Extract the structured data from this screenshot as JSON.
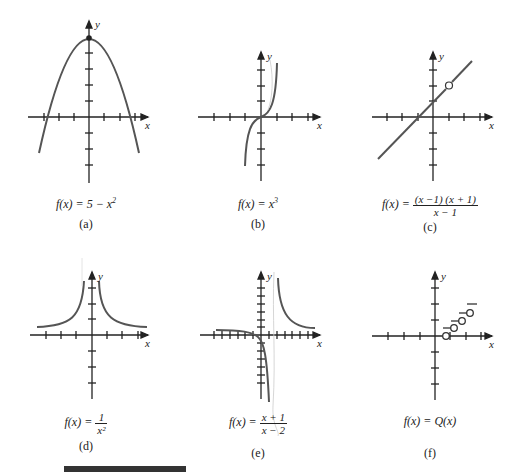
{
  "figure": {
    "panels": [
      {
        "id": "a",
        "label": "(a)",
        "formula_lhs": "f(x) = ",
        "formula_rhs": "5 − x",
        "formula_sup": "2",
        "type": "parabola"
      },
      {
        "id": "b",
        "label": "(b)",
        "formula_lhs": "f(x) = ",
        "formula_rhs": "x",
        "formula_sup": "3",
        "type": "cubic"
      },
      {
        "id": "c",
        "label": "(c)",
        "formula_lhs": "f(x) = ",
        "formula_num": "(x −1) (x + 1)",
        "formula_den": "x − 1",
        "type": "line-with-hole"
      },
      {
        "id": "d",
        "label": "(d)",
        "formula_lhs": "f(x) = ",
        "formula_num": "1",
        "formula_den": "x²",
        "type": "inverse-square"
      },
      {
        "id": "e",
        "label": "(e)",
        "formula_lhs": "f(x) = ",
        "formula_num": "x + 1",
        "formula_den": "x − 2",
        "type": "rational"
      },
      {
        "id": "f",
        "label": "(f)",
        "formula_lhs": "f(x) = ",
        "formula_rhs": "Q(x)",
        "type": "step"
      }
    ],
    "axis_labels": {
      "x": "x",
      "y": "y"
    }
  },
  "colors": {
    "curve": "#555555",
    "axis": "#222222"
  }
}
